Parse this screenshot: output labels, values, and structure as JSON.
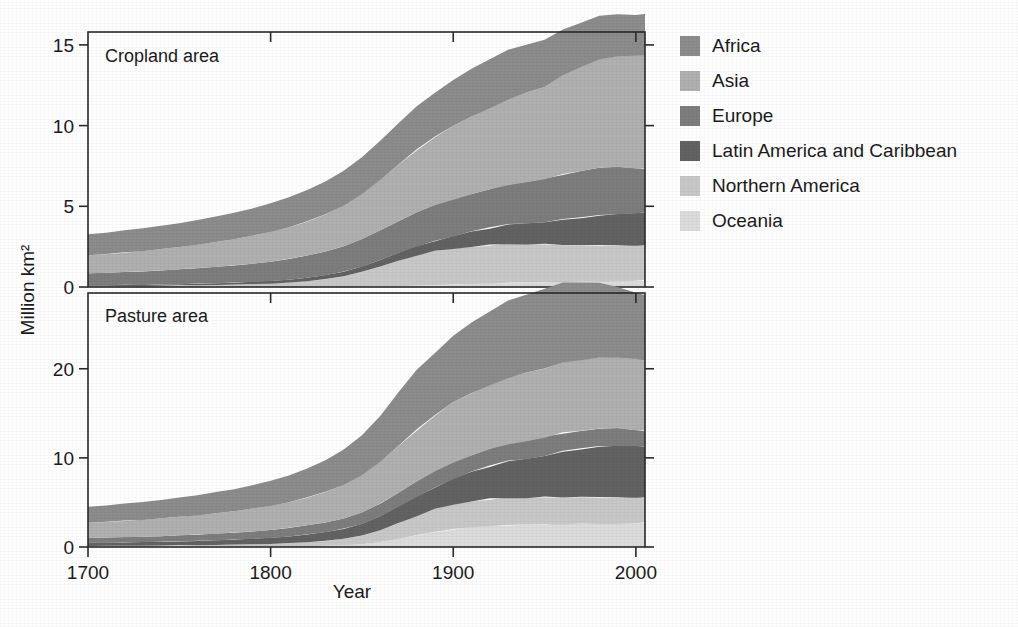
{
  "figure": {
    "xlabel": "Year",
    "ylabel": "Million km²",
    "background": "#ffffff"
  },
  "legend": {
    "position": "right",
    "items": [
      {
        "label": "Africa",
        "color": "#8c8c8c"
      },
      {
        "label": "Asia",
        "color": "#b0b0b0"
      },
      {
        "label": "Europe",
        "color": "#7d7d7d"
      },
      {
        "label": "Latin America and Caribbean",
        "color": "#626262"
      },
      {
        "label": "Northern America",
        "color": "#c8c8c8"
      },
      {
        "label": "Oceania",
        "color": "#dcdcdc"
      }
    ]
  },
  "chart_data": [
    {
      "type": "area",
      "id": "cropland",
      "title": "Cropland area",
      "stacked": true,
      "xlabel": "",
      "ylabel": "Million km²",
      "xlim": [
        1700,
        2005
      ],
      "ylim": [
        0,
        15.8
      ],
      "xticks": [
        1700,
        1800,
        1900,
        2000
      ],
      "yticks": [
        0,
        5,
        10,
        15
      ],
      "grid": false,
      "stack_order_bottom_to_top": [
        "Oceania",
        "Northern America",
        "Latin America and Caribbean",
        "Europe",
        "Asia",
        "Africa"
      ],
      "x": [
        1700,
        1710,
        1720,
        1730,
        1740,
        1750,
        1760,
        1770,
        1780,
        1790,
        1800,
        1810,
        1820,
        1830,
        1840,
        1850,
        1860,
        1870,
        1880,
        1890,
        1900,
        1910,
        1920,
        1930,
        1940,
        1950,
        1960,
        1970,
        1980,
        1990,
        2000,
        2005
      ],
      "series": [
        {
          "name": "Oceania",
          "values": [
            0.0,
            0.0,
            0.0,
            0.0,
            0.0,
            0.0,
            0.0,
            0.0,
            0.0,
            0.0,
            0.0,
            0.0,
            0.0,
            0.01,
            0.01,
            0.02,
            0.03,
            0.05,
            0.08,
            0.12,
            0.15,
            0.18,
            0.22,
            0.26,
            0.28,
            0.3,
            0.32,
            0.34,
            0.36,
            0.38,
            0.4,
            0.41
          ]
        },
        {
          "name": "Northern America",
          "values": [
            0.05,
            0.05,
            0.06,
            0.07,
            0.08,
            0.09,
            0.11,
            0.13,
            0.15,
            0.18,
            0.22,
            0.28,
            0.36,
            0.48,
            0.66,
            0.92,
            1.25,
            1.58,
            1.88,
            2.1,
            2.22,
            2.32,
            2.38,
            2.42,
            2.4,
            2.35,
            2.3,
            2.24,
            2.22,
            2.2,
            2.18,
            2.16
          ]
        },
        {
          "name": "Latin America and Caribbean",
          "values": [
            0.06,
            0.06,
            0.07,
            0.07,
            0.08,
            0.09,
            0.1,
            0.11,
            0.12,
            0.14,
            0.16,
            0.18,
            0.21,
            0.24,
            0.28,
            0.33,
            0.4,
            0.48,
            0.56,
            0.66,
            0.78,
            0.92,
            1.05,
            1.18,
            1.28,
            1.4,
            1.55,
            1.72,
            1.86,
            1.96,
            2.02,
            2.04
          ]
        },
        {
          "name": "Europe",
          "values": [
            0.74,
            0.77,
            0.8,
            0.83,
            0.87,
            0.91,
            0.96,
            1.01,
            1.07,
            1.13,
            1.2,
            1.28,
            1.37,
            1.47,
            1.58,
            1.7,
            1.83,
            1.96,
            2.08,
            2.18,
            2.28,
            2.36,
            2.42,
            2.5,
            2.58,
            2.66,
            2.8,
            2.92,
            2.96,
            2.9,
            2.78,
            2.74
          ]
        },
        {
          "name": "Asia",
          "values": [
            1.12,
            1.16,
            1.21,
            1.26,
            1.32,
            1.38,
            1.45,
            1.53,
            1.62,
            1.72,
            1.84,
            1.97,
            2.12,
            2.3,
            2.52,
            2.78,
            3.12,
            3.52,
            3.9,
            4.25,
            4.55,
            4.82,
            5.05,
            5.28,
            5.48,
            5.7,
            6.1,
            6.45,
            6.72,
            6.88,
            6.95,
            6.98
          ]
        },
        {
          "name": "Africa",
          "values": [
            1.3,
            1.33,
            1.36,
            1.4,
            1.44,
            1.48,
            1.53,
            1.58,
            1.64,
            1.7,
            1.77,
            1.85,
            1.94,
            2.04,
            2.15,
            2.28,
            2.42,
            2.56,
            2.68,
            2.78,
            2.88,
            2.96,
            3.02,
            3.05,
            3.02,
            2.95,
            2.84,
            2.74,
            2.66,
            2.6,
            2.58,
            2.58
          ]
        }
      ]
    },
    {
      "type": "area",
      "id": "pasture",
      "title": "Pasture area",
      "stacked": true,
      "xlabel": "Year",
      "ylabel": "Million km²",
      "xlim": [
        1700,
        2005
      ],
      "ylim": [
        0,
        28.5
      ],
      "xticks": [
        1700,
        1800,
        1900,
        2000
      ],
      "yticks": [
        0,
        10,
        20
      ],
      "grid": false,
      "stack_order_bottom_to_top": [
        "Oceania",
        "Northern America",
        "Latin America and Caribbean",
        "Europe",
        "Asia",
        "Africa"
      ],
      "x": [
        1700,
        1710,
        1720,
        1730,
        1740,
        1750,
        1760,
        1770,
        1780,
        1790,
        1800,
        1810,
        1820,
        1830,
        1840,
        1850,
        1860,
        1870,
        1880,
        1890,
        1900,
        1910,
        1920,
        1930,
        1940,
        1950,
        1960,
        1970,
        1980,
        1990,
        2000,
        2005
      ],
      "series": [
        {
          "name": "Oceania",
          "values": [
            0.02,
            0.02,
            0.02,
            0.02,
            0.03,
            0.03,
            0.03,
            0.04,
            0.04,
            0.05,
            0.06,
            0.08,
            0.1,
            0.14,
            0.2,
            0.32,
            0.55,
            0.9,
            1.3,
            1.7,
            2.0,
            2.2,
            2.35,
            2.45,
            2.5,
            2.55,
            2.6,
            2.62,
            2.64,
            2.66,
            2.68,
            2.68
          ]
        },
        {
          "name": "Northern America",
          "values": [
            0.1,
            0.11,
            0.12,
            0.13,
            0.14,
            0.16,
            0.18,
            0.2,
            0.23,
            0.26,
            0.3,
            0.36,
            0.44,
            0.55,
            0.72,
            0.98,
            1.35,
            1.8,
            2.2,
            2.55,
            2.8,
            2.95,
            3.05,
            3.1,
            3.08,
            3.05,
            3.0,
            2.96,
            2.94,
            2.92,
            2.9,
            2.88
          ]
        },
        {
          "name": "Latin America and Caribbean",
          "values": [
            0.35,
            0.36,
            0.38,
            0.4,
            0.42,
            0.45,
            0.48,
            0.52,
            0.56,
            0.62,
            0.68,
            0.76,
            0.86,
            0.98,
            1.12,
            1.3,
            1.55,
            1.85,
            2.15,
            2.48,
            2.85,
            3.25,
            3.65,
            4.05,
            4.35,
            4.7,
            5.1,
            5.45,
            5.7,
            5.82,
            5.8,
            5.72
          ]
        },
        {
          "name": "Europe",
          "values": [
            0.55,
            0.57,
            0.59,
            0.61,
            0.64,
            0.67,
            0.7,
            0.74,
            0.78,
            0.83,
            0.88,
            0.94,
            1.01,
            1.09,
            1.18,
            1.28,
            1.4,
            1.52,
            1.64,
            1.76,
            1.88,
            1.94,
            1.98,
            2.02,
            2.04,
            2.06,
            2.08,
            2.06,
            2.02,
            1.92,
            1.8,
            1.74
          ]
        },
        {
          "name": "Asia",
          "values": [
            1.7,
            1.76,
            1.83,
            1.9,
            1.98,
            2.07,
            2.17,
            2.28,
            2.4,
            2.54,
            2.7,
            2.9,
            3.14,
            3.42,
            3.76,
            4.18,
            4.7,
            5.3,
            5.85,
            6.3,
            6.7,
            7.0,
            7.2,
            7.4,
            7.55,
            7.7,
            7.85,
            7.95,
            8.0,
            8.0,
            7.95,
            7.9
          ]
        },
        {
          "name": "Africa",
          "values": [
            1.8,
            1.86,
            1.92,
            1.99,
            2.07,
            2.16,
            2.26,
            2.37,
            2.49,
            2.63,
            2.8,
            3.0,
            3.25,
            3.56,
            3.95,
            4.45,
            5.15,
            6.0,
            6.7,
            7.1,
            7.55,
            7.95,
            8.25,
            8.6,
            8.85,
            9.0,
            8.95,
            8.7,
            8.3,
            7.9,
            7.5,
            7.35
          ]
        }
      ]
    }
  ],
  "panels": {
    "cropland": {
      "title": "Cropland area"
    },
    "pasture": {
      "title": "Pasture area"
    }
  }
}
